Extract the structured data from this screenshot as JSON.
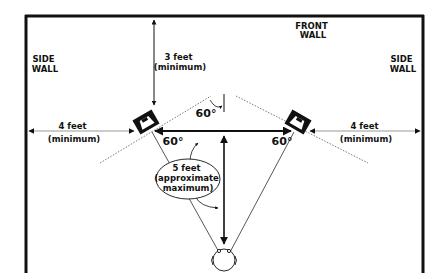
{
  "diagram": {
    "walls": {
      "front": [
        "FRONT",
        "WALL"
      ],
      "left_side": [
        "SIDE",
        "WALL"
      ],
      "right_side": [
        "SIDE",
        "WALL"
      ]
    },
    "dimensions": {
      "front_clearance": [
        "3 feet",
        "(minimum)"
      ],
      "left_side_clearance": [
        "4 feet",
        "(minimum)"
      ],
      "right_side_clearance": [
        "4 feet",
        "(minimum)"
      ],
      "listener_distance": [
        "5 feet",
        "(approximate",
        "maximum)"
      ]
    },
    "angles": {
      "toe_in": "60°",
      "left_triangle": "60°",
      "right_triangle": "60°"
    },
    "elements": [
      "left speaker",
      "right speaker",
      "listener head"
    ],
    "colors": {
      "line": "#111111",
      "background": "#ffffff",
      "dotted": "#555555"
    }
  }
}
